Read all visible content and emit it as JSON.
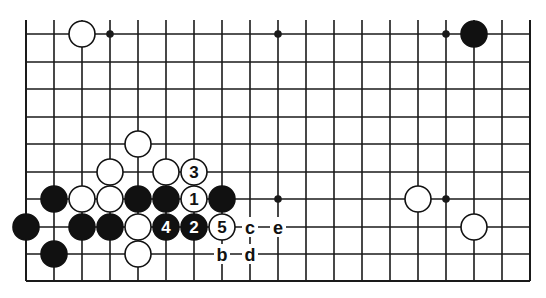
{
  "diagram": {
    "type": "go-board-partial",
    "columns": 19,
    "rows_shown": 10,
    "top_edge_open": true,
    "grid": {
      "x0": 26,
      "dx": 28,
      "ys": [
        34,
        62,
        89,
        117,
        144,
        172,
        199,
        227,
        254,
        281
      ],
      "line_color": "#1a1a1a",
      "top_extension": 14
    },
    "star_points": [
      {
        "col": 3,
        "row": 0
      },
      {
        "col": 9,
        "row": 0
      },
      {
        "col": 15,
        "row": 0
      },
      {
        "col": 9,
        "row": 6
      },
      {
        "col": 15,
        "row": 6
      }
    ],
    "stones": [
      {
        "color": "white",
        "col": 2,
        "row": 0
      },
      {
        "color": "black",
        "col": 16,
        "row": 0
      },
      {
        "color": "white",
        "col": 4,
        "row": 4
      },
      {
        "color": "white",
        "col": 3,
        "row": 5
      },
      {
        "color": "white",
        "col": 5,
        "row": 5
      },
      {
        "color": "white",
        "col": 6,
        "row": 5,
        "label": "3"
      },
      {
        "color": "black",
        "col": 1,
        "row": 6
      },
      {
        "color": "white",
        "col": 2,
        "row": 6
      },
      {
        "color": "white",
        "col": 3,
        "row": 6
      },
      {
        "color": "black",
        "col": 4,
        "row": 6
      },
      {
        "color": "black",
        "col": 5,
        "row": 6
      },
      {
        "color": "white",
        "col": 6,
        "row": 6,
        "label": "1"
      },
      {
        "color": "black",
        "col": 7,
        "row": 6
      },
      {
        "color": "white",
        "col": 14,
        "row": 6
      },
      {
        "color": "black",
        "col": 0,
        "row": 7
      },
      {
        "color": "black",
        "col": 2,
        "row": 7
      },
      {
        "color": "black",
        "col": 3,
        "row": 7
      },
      {
        "color": "white",
        "col": 4,
        "row": 7
      },
      {
        "color": "black",
        "col": 5,
        "row": 7,
        "label": "4"
      },
      {
        "color": "black",
        "col": 6,
        "row": 7,
        "label": "2"
      },
      {
        "color": "white",
        "col": 7,
        "row": 7,
        "label": "5"
      },
      {
        "color": "white",
        "col": 16,
        "row": 7
      },
      {
        "color": "black",
        "col": 1,
        "row": 8
      },
      {
        "color": "white",
        "col": 4,
        "row": 8
      }
    ],
    "marks": [
      {
        "label": "a",
        "col": 5,
        "row": 5
      },
      {
        "label": "c",
        "col": 8,
        "row": 7
      },
      {
        "label": "e",
        "col": 9,
        "row": 7
      },
      {
        "label": "b",
        "col": 7,
        "row": 8
      },
      {
        "label": "d",
        "col": 8,
        "row": 8
      }
    ],
    "colors": {
      "black_stone": "#111111",
      "white_stone": "#ffffff",
      "outline": "#111111",
      "background": "#ffffff"
    }
  }
}
